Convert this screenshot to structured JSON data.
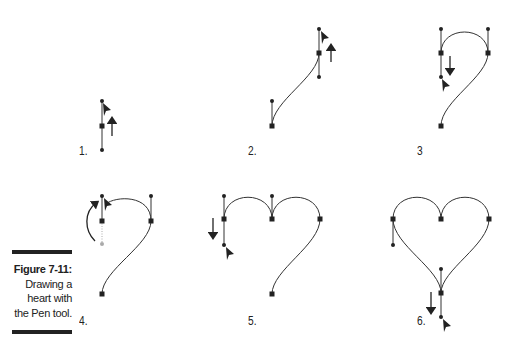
{
  "figure": {
    "caption_title": "Figure 7-11:",
    "caption_lines": [
      "Drawing a",
      "heart with",
      "the Pen tool."
    ]
  },
  "steps": [
    {
      "label": "1."
    },
    {
      "label": "2."
    },
    {
      "label": "3"
    },
    {
      "label": "4."
    },
    {
      "label": "5."
    },
    {
      "label": "6."
    }
  ],
  "colors": {
    "stroke": "#333333",
    "caption_bar": "#222222",
    "dimmed_handle": "#aaaaaa"
  }
}
